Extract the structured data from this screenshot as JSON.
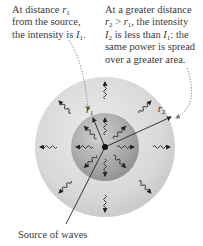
{
  "captions": {
    "left": {
      "lines": [
        "At distance r1",
        "from the source,",
        "the intensity is I1."
      ],
      "l1_text": "At distance ",
      "l1_var": "r",
      "l1_sub": "1",
      "l2_text": "from the source,",
      "l3_text": "the intensity is ",
      "l3_var": "I",
      "l3_sub": "1",
      "l3_end": "."
    },
    "right": {
      "l1_text": "At a greater distance",
      "l2_var1": "r",
      "l2_sub1": "2",
      "l2_op": " > ",
      "l2_var2": "r",
      "l2_sub2": "1",
      "l2_end": ", the intensity",
      "l3_var1": "I",
      "l3_sub1": "2",
      "l3_mid": " is less than ",
      "l3_var2": "I",
      "l3_sub2": "1",
      "l3_end": ": the",
      "l4_text": "same power is spread",
      "l5_text": "over a greater area."
    },
    "bottom": {
      "text": "Source of waves"
    }
  },
  "diagram": {
    "center": [
      105,
      147
    ],
    "outer_radius": 70,
    "inner_radius": 34,
    "labels": {
      "r1": "r",
      "r1_sub": "1",
      "r2": "r",
      "r2_sub": "2"
    },
    "colors": {
      "outer_fill": "#d4d4d4",
      "outer_fill_light": "#e6e6e6",
      "inner_fill": "#a8a8a8",
      "inner_fill_light": "#c8c8c8",
      "line": "#222222",
      "dotted": "#777777"
    }
  }
}
